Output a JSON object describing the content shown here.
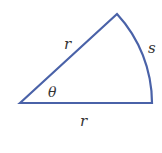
{
  "diagram": {
    "colors": {
      "stroke": "#4a62a8",
      "label": "#333333",
      "background": "#ffffff"
    },
    "labels": {
      "radius_upper": "r",
      "radius_lower": "r",
      "arc": "s",
      "angle": "θ"
    },
    "geometry": {
      "vertex": [
        20,
        103
      ],
      "apex": [
        117,
        14
      ],
      "corner": [
        152,
        103
      ],
      "radius_px": 132
    }
  }
}
